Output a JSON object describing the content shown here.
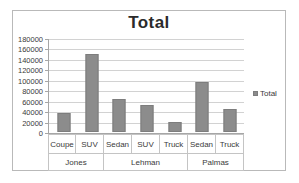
{
  "chart_data": {
    "type": "bar",
    "title": "Total",
    "xlabel": "",
    "ylabel": "",
    "ylim": [
      0,
      180000
    ],
    "ytick_step": 20000,
    "yticks": [
      180000,
      160000,
      140000,
      120000,
      100000,
      80000,
      60000,
      40000,
      20000,
      0
    ],
    "ytick_labels": [
      "180000",
      "160000",
      "140000",
      "120000",
      "100000",
      "80000",
      "60000",
      "40000",
      "20000",
      "0"
    ],
    "grid": true,
    "legend": [
      "Total"
    ],
    "legend_position": "right",
    "bar_color": "#8c8c8c",
    "categories": [
      "Coupe",
      "SUV",
      "Sedan",
      "SUV",
      "Truck",
      "Sedan",
      "Truck"
    ],
    "groups": [
      {
        "label": "Jones",
        "span": 2
      },
      {
        "label": "Lehman",
        "span": 3
      },
      {
        "label": "Palmas",
        "span": 2
      }
    ],
    "series": [
      {
        "name": "Total",
        "values": [
          36000,
          151000,
          63000,
          52000,
          19000,
          97000,
          45000
        ]
      }
    ]
  }
}
